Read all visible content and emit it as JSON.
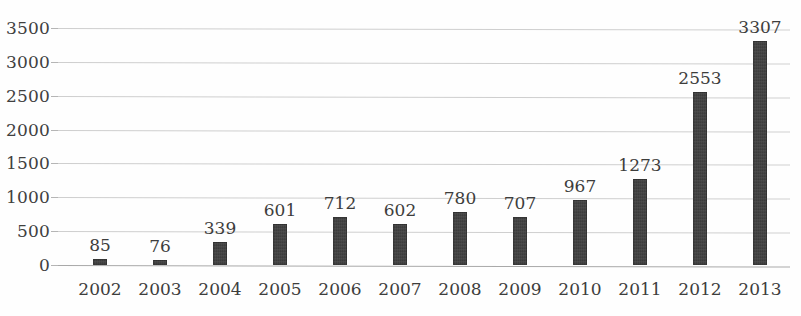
{
  "chart_data": {
    "type": "bar",
    "title": "",
    "subtitle": "",
    "xlabel": "",
    "ylabel": "",
    "categories": [
      "2002",
      "2003",
      "2004",
      "2005",
      "2006",
      "2007",
      "2008",
      "2009",
      "2010",
      "2011",
      "2012",
      "2013"
    ],
    "values": [
      85,
      76,
      339,
      601,
      712,
      602,
      780,
      707,
      967,
      1273,
      2553,
      3307
    ],
    "data_labels": [
      "85",
      "76",
      "339",
      "601",
      "712",
      "602",
      "780",
      "707",
      "967",
      "1273",
      "2553",
      "3307"
    ],
    "ylim": [
      0,
      3500
    ],
    "yticks": [
      0,
      500,
      1000,
      1500,
      2000,
      2500,
      3000,
      3500
    ],
    "ytick_labels": [
      "0",
      "500",
      "1000",
      "1500",
      "2000",
      "2500",
      "3000",
      "3500"
    ],
    "grid": true,
    "grid_axis": "y",
    "legend": false,
    "legend_position": "none",
    "annotations": [],
    "series": [
      {
        "name": "",
        "values": [
          85,
          76,
          339,
          601,
          712,
          602,
          780,
          707,
          967,
          1273,
          2553,
          3307
        ]
      }
    ]
  },
  "style": {
    "bar_color": "#3c3c3c",
    "grid_color": "#cfcfcf",
    "axis_color": "#a9a9a9",
    "text_color": "#3d3d3c",
    "background": "#fefefe"
  }
}
